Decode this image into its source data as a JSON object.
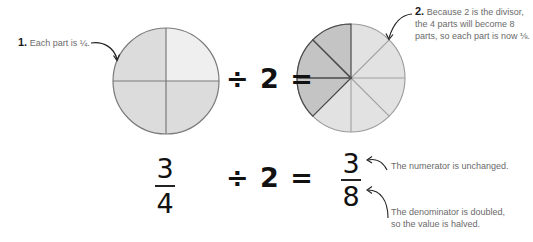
{
  "top_row": {
    "annotation_1": {
      "number": "1.",
      "text": "Each part is ¼."
    },
    "operator": "÷ 2 =",
    "annotation_2": {
      "number": "2.",
      "lines": [
        "Because 2 is the divisor,",
        "the 4 parts will become 8",
        "parts, so each part is now ⅛."
      ]
    },
    "pie_quarters": {
      "parts": 4,
      "shaded": 3,
      "colors": {
        "shaded": "#dcdcdc",
        "unshaded": "#efefef",
        "stroke": "#7a7a7a"
      }
    },
    "pie_eighths": {
      "parts": 8,
      "shaded": 3,
      "colors": {
        "shaded": "#c4c4c4",
        "unshaded": "#e2e2e2",
        "stroke_light": "#a0a0a0",
        "stroke_dark": "#4a4a4a"
      }
    }
  },
  "bottom_row": {
    "fraction_left": {
      "numerator": "3",
      "denominator": "4"
    },
    "operator": "÷ 2 =",
    "fraction_right": {
      "numerator": "3",
      "denominator": "8"
    },
    "note_numerator": "The numerator is unchanged.",
    "note_denominator": [
      "The denominator is doubled,",
      "so the value is halved."
    ]
  }
}
